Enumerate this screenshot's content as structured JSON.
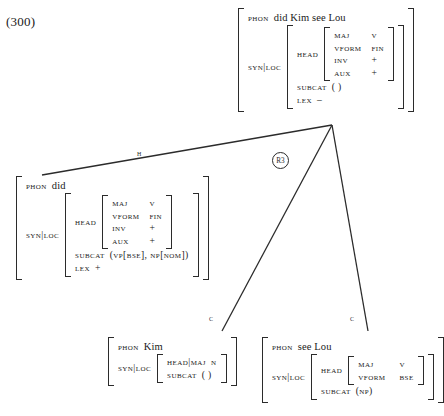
{
  "example": {
    "number": "(300)"
  },
  "nodes": {
    "root": {
      "phon_label": "PHON",
      "phon_value": "did Kim see Lou",
      "syn_label": "SYN|LOC",
      "head_label": "HEAD",
      "head_features": [
        {
          "name": "MAJ",
          "value": "V"
        },
        {
          "name": "VFORM",
          "value": "FIN"
        },
        {
          "name": "INV",
          "value": "+"
        },
        {
          "name": "AUX",
          "value": "+"
        }
      ],
      "subcat_label": "SUBCAT",
      "subcat_value": "( )",
      "lex_label": "LEX",
      "lex_value": "–"
    },
    "head_daughter": {
      "phon_label": "PHON",
      "phon_value": "did",
      "syn_label": "SYN|LOC",
      "head_label": "HEAD",
      "head_features": [
        {
          "name": "MAJ",
          "value": "V"
        },
        {
          "name": "VFORM",
          "value": "FIN"
        },
        {
          "name": "INV",
          "value": "+"
        },
        {
          "name": "AUX",
          "value": "+"
        }
      ],
      "subcat_label": "SUBCAT",
      "subcat_value": "(VP[BSE], NP[NOM])",
      "lex_label": "LEX",
      "lex_value": "+"
    },
    "comp_left": {
      "phon_label": "PHON",
      "phon_value": "Kim",
      "syn_label": "SYN|LOC",
      "headmaj_label": "HEAD|MAJ",
      "headmaj_value": "N",
      "subcat_label": "SUBCAT",
      "subcat_value": "( )"
    },
    "comp_right": {
      "phon_label": "PHON",
      "phon_value": "see Lou",
      "syn_label": "SYN|LOC",
      "head_label": "HEAD",
      "head_features": [
        {
          "name": "MAJ",
          "value": "V"
        },
        {
          "name": "VFORM",
          "value": "BSE"
        }
      ],
      "subcat_label": "SUBCAT",
      "subcat_value": "(NP)"
    }
  },
  "edges": {
    "head_label": "H",
    "comp_left_label": "C",
    "comp_right_label": "C",
    "rule_badge": "R3"
  },
  "style": {
    "ink": "#2b2b2b",
    "background": "#ffffff"
  }
}
